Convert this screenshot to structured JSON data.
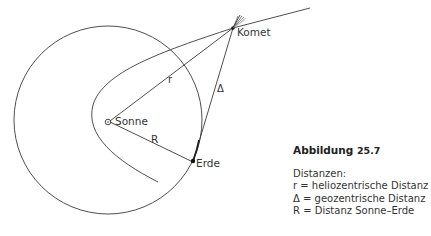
{
  "figure": {
    "title": "Abbildung",
    "number": "25.7",
    "legend_heading": "Distanzen:",
    "legend": [
      {
        "symbol": "r",
        "text": "r = heliozentrische Distanz"
      },
      {
        "symbol": "Δ",
        "text": "Δ = geozentrische Distanz"
      },
      {
        "symbol": "R",
        "text": "R = Distanz Sonne–Erde"
      }
    ]
  },
  "labels": {
    "sun": "Sonne",
    "earth": "Erde",
    "comet": "Komet",
    "r": "r",
    "delta": "Δ",
    "R": "R"
  },
  "colors": {
    "line": "#3a3a3a",
    "text": "#333333"
  }
}
